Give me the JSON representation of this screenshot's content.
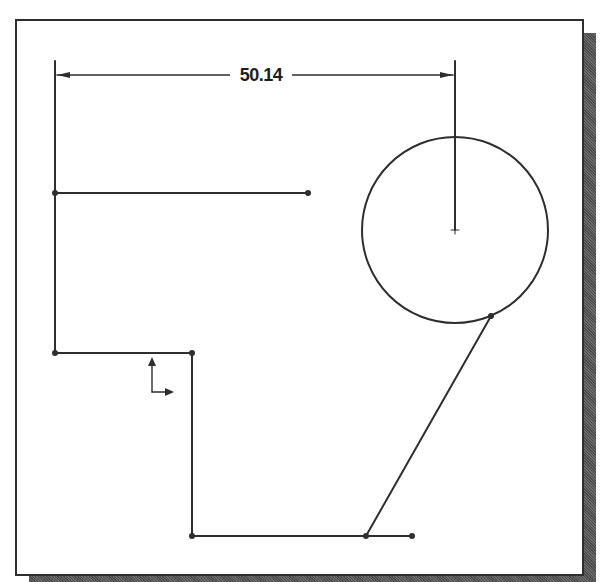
{
  "diagram": {
    "type": "cad-sketch",
    "colors": {
      "line": "#2e2e2e",
      "frame_border": "#2e2e2e",
      "shadow": "#5a5a5a",
      "background": "#ffffff"
    },
    "dimension": {
      "label": "50.14",
      "from": [
        55,
        75
      ],
      "to": [
        455,
        75
      ]
    },
    "lines": [
      {
        "name": "left-vertical-line",
        "from": [
          55,
          193
        ],
        "to": [
          55,
          353
        ]
      },
      {
        "name": "upper-horizontal-line",
        "from": [
          55,
          193
        ],
        "to": [
          308,
          193
        ]
      },
      {
        "name": "middle-horizontal-line",
        "from": [
          55,
          353
        ],
        "to": [
          192,
          353
        ]
      },
      {
        "name": "inner-vertical-line",
        "from": [
          192,
          353
        ],
        "to": [
          192,
          536
        ]
      },
      {
        "name": "bottom-horizontal-line",
        "from": [
          192,
          536
        ],
        "to": [
          412,
          536
        ]
      },
      {
        "name": "slanted-line",
        "from": [
          366,
          536
        ],
        "to": [
          491,
          316
        ]
      }
    ],
    "circle": {
      "center": [
        455,
        230
      ],
      "radius": 93
    },
    "points": [
      [
        55,
        193
      ],
      [
        308,
        193
      ],
      [
        55,
        353
      ],
      [
        192,
        353
      ],
      [
        192,
        536
      ],
      [
        366,
        536
      ],
      [
        412,
        536
      ],
      [
        491,
        316
      ]
    ],
    "origin_marker": {
      "at": [
        152,
        392
      ]
    }
  }
}
